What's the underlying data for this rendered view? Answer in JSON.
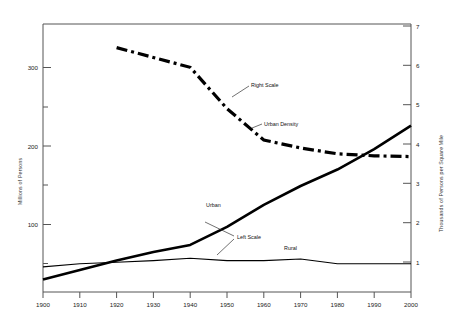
{
  "chart_data": {
    "type": "line",
    "title": "",
    "subtitle": "",
    "xlabel": "",
    "ylabel": "Millions of Persons",
    "y2label": "Thousands of Persons per Square Mile",
    "xlim": [
      1900,
      2000
    ],
    "ylim": [
      0,
      350
    ],
    "y2lim": [
      0,
      7
    ],
    "grid": false,
    "legend": "inline-annotations",
    "x_ticks": [
      1900,
      1910,
      1920,
      1930,
      1940,
      1950,
      1960,
      1970,
      1980,
      1990,
      2000
    ],
    "x_tick_labels": [
      "1900",
      "1910",
      "1920",
      "1930",
      "1940",
      "1950",
      "1960",
      "1970",
      "1980",
      "1990",
      "2000"
    ],
    "y_ticks": [
      100,
      200,
      300
    ],
    "y_tick_labels": [
      "100",
      "200",
      "300"
    ],
    "y_minor_ticks": [
      50,
      150,
      250
    ],
    "y2_ticks": [
      1,
      2,
      3,
      4,
      5,
      6,
      7
    ],
    "y2_tick_labels": [
      "1",
      "2",
      "3",
      "4",
      "5",
      "6",
      "7"
    ],
    "series": [
      {
        "name": "Urban",
        "axis": "left",
        "style": "solid-thick",
        "units": "Millions of Persons",
        "x": [
          1900,
          1910,
          1920,
          1930,
          1940,
          1950,
          1960,
          1970,
          1980,
          1990,
          2000
        ],
        "values": [
          30,
          42,
          54,
          65,
          74,
          97,
          125,
          149,
          170,
          196,
          226
        ]
      },
      {
        "name": "Rural",
        "axis": "left",
        "style": "solid-thin",
        "units": "Millions of Persons",
        "x": [
          1900,
          1910,
          1920,
          1930,
          1940,
          1950,
          1960,
          1970,
          1980,
          1990,
          2000
        ],
        "values": [
          46,
          50,
          52,
          54,
          57,
          54,
          54,
          56,
          50,
          50,
          50
        ]
      },
      {
        "name": "Urban Density",
        "axis": "right",
        "style": "dash-dot-thick",
        "units": "Thousands of Persons per Square Mile",
        "x": [
          1920,
          1930,
          1940,
          1950,
          1960,
          1970,
          1980,
          1990,
          2000
        ],
        "values": [
          6.45,
          6.2,
          5.95,
          4.9,
          4.1,
          3.9,
          3.75,
          3.7,
          3.68
        ]
      }
    ],
    "annotations": [
      {
        "text": "Right Scale",
        "target_series": "Urban Density",
        "x": 1938,
        "y2": 5.1
      },
      {
        "text": "Urban Density",
        "target_series": "Urban Density",
        "x": 1950,
        "y2": 4.35
      },
      {
        "text": "Urban",
        "target_series": "Urban",
        "x": 1953,
        "y": 140
      },
      {
        "text": "Left Scale",
        "target_series": "Urban, Rural",
        "x": 1958,
        "y": 88
      },
      {
        "text": "Rural",
        "target_series": "Rural",
        "x": 1972,
        "y": 68
      }
    ]
  },
  "axes": {
    "left_title": "Millions of Persons",
    "right_title": "Thousands of Persons per Square Mile"
  },
  "labels": {
    "right_scale": "Right Scale",
    "urban_density": "Urban Density",
    "urban": "Urban",
    "left_scale": "Left Scale",
    "rural": "Rural"
  },
  "x_axis": {
    "t1900": "1900",
    "t1910": "1910",
    "t1920": "1920",
    "t1930": "1930",
    "t1940": "1940",
    "t1950": "1950",
    "t1960": "1960",
    "t1970": "1970",
    "t1980": "1980",
    "t1990": "1990",
    "t2000": "2000"
  },
  "y_axis_left": {
    "t100": "100",
    "t200": "200",
    "t300": "300"
  },
  "y_axis_right": {
    "t1": "1",
    "t2": "2",
    "t3": "3",
    "t4": "4",
    "t5": "5",
    "t6": "6",
    "t7": "7"
  }
}
